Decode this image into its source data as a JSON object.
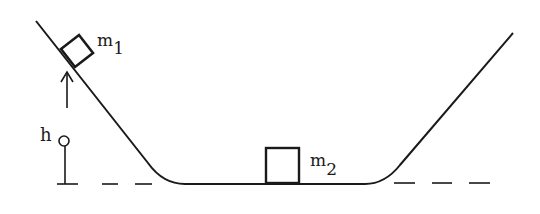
{
  "diagram": {
    "labels": {
      "mass1": "m",
      "mass1_sub": "1",
      "mass2": "m",
      "mass2_sub": "2",
      "height": "h",
      "height_sub": "o"
    },
    "colors": {
      "stroke": "#1a1a1a",
      "background": "#ffffff"
    }
  }
}
